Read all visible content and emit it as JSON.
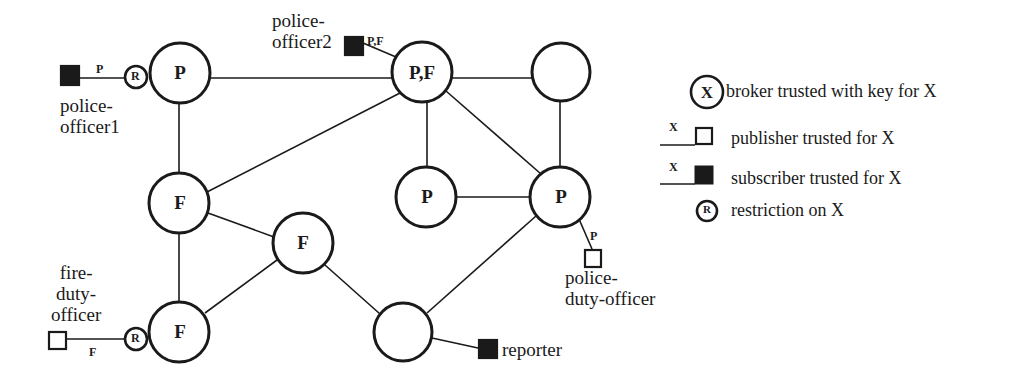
{
  "brokers": [
    {
      "id": "b1",
      "label": "P",
      "x": 180,
      "y": 73,
      "r": 30
    },
    {
      "id": "b2",
      "label": "P,F",
      "x": 422,
      "y": 72,
      "r": 30
    },
    {
      "id": "b3",
      "label": "",
      "x": 561,
      "y": 72,
      "r": 29
    },
    {
      "id": "b4",
      "label": "F",
      "x": 179,
      "y": 203,
      "r": 30
    },
    {
      "id": "b5",
      "label": "P",
      "x": 426,
      "y": 197,
      "r": 30
    },
    {
      "id": "b6",
      "label": "P",
      "x": 560,
      "y": 197,
      "r": 30
    },
    {
      "id": "b7",
      "label": "F",
      "x": 303,
      "y": 243,
      "r": 30
    },
    {
      "id": "b8",
      "label": "F",
      "x": 179,
      "y": 332,
      "r": 30
    },
    {
      "id": "b9",
      "label": "",
      "x": 403,
      "y": 332,
      "r": 29
    }
  ],
  "edges": [
    [
      "b1",
      "b2"
    ],
    [
      "b2",
      "b3"
    ],
    [
      "b1",
      "b4"
    ],
    [
      "b2",
      "b4"
    ],
    [
      "b2",
      "b5"
    ],
    [
      "b2",
      "b6"
    ],
    [
      "b3",
      "b6"
    ],
    [
      "b5",
      "b6"
    ],
    [
      "b4",
      "b7"
    ],
    [
      "b4",
      "b8"
    ],
    [
      "b7",
      "b8"
    ],
    [
      "b7",
      "b9"
    ],
    [
      "b6",
      "b9"
    ]
  ],
  "clients": [
    {
      "id": "police-officer1",
      "kind": "subscriber",
      "name": "police-officer1",
      "label_lines": "police-\nofficer1",
      "trust": "P",
      "restricted": true
    },
    {
      "id": "police-officer2",
      "kind": "subscriber",
      "name": "police-officer2",
      "label_lines": "police-\nofficer2",
      "trust": "P,F",
      "restricted": false
    },
    {
      "id": "police-duty-officer",
      "kind": "publisher",
      "name": "police-duty-officer",
      "label_lines": "police-\nduty-officer",
      "trust": "P",
      "restricted": false
    },
    {
      "id": "fire-duty-officer",
      "kind": "publisher",
      "name": "fire-duty-officer",
      "label_lines": "fire-\nduty-\nofficer",
      "trust": "F",
      "restricted": true
    },
    {
      "id": "reporter",
      "kind": "subscriber",
      "name": "reporter",
      "label_lines": "reporter",
      "trust": "",
      "restricted": false
    }
  ],
  "restriction_symbol": "R",
  "legend": {
    "broker": {
      "symbol": "X",
      "text": "broker trusted with key for X"
    },
    "publisher": {
      "symbol": "X",
      "text": "publisher trusted for X"
    },
    "subscriber": {
      "symbol": "X",
      "text": "subscriber trusted for X"
    },
    "restriction": {
      "symbol": "R",
      "text": "restriction on X"
    }
  },
  "colors": {
    "stroke": "#1a1a1a",
    "fill_subscriber": "#1a1a1a",
    "background": "#ffffff"
  }
}
